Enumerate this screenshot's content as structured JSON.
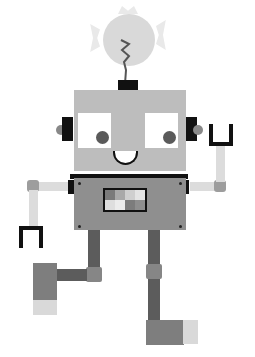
{
  "illustration": {
    "subject": "cartoon robot with lightbulb antenna, waving",
    "palette": {
      "background": "#ffffff",
      "head": "#bdbdbd",
      "body": "#8f8f8f",
      "dark": "#111111",
      "legs": "#5c5c5c",
      "arms": "#dcdcdc",
      "bulb": "#d9d9d9"
    },
    "screen_cells": [
      "#7a7a7a",
      "#a9a9a9",
      "#cfcfcf",
      "#e4e4e4",
      "#dedede",
      "#ececec",
      "#7c7c7c",
      "#8e8e8e"
    ]
  }
}
